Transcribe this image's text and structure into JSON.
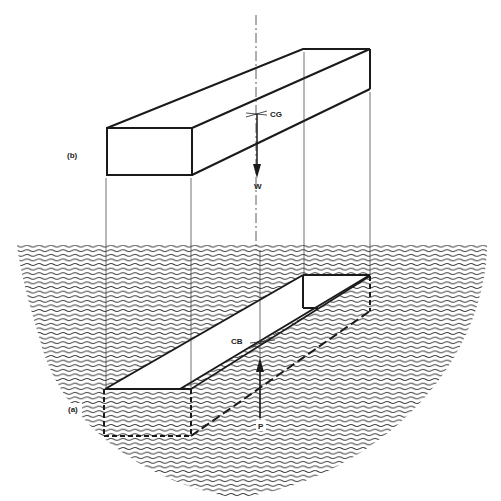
{
  "diagram": {
    "labels": {
      "top_view": "(b)",
      "bottom_view": "(a)",
      "center_of_gravity": "CG",
      "center_of_buoyancy": "CB",
      "weight": "W",
      "buoyant_force": "P"
    },
    "colors": {
      "line": "#1a1a1a",
      "water": "#333333",
      "background": "#ffffff"
    }
  }
}
